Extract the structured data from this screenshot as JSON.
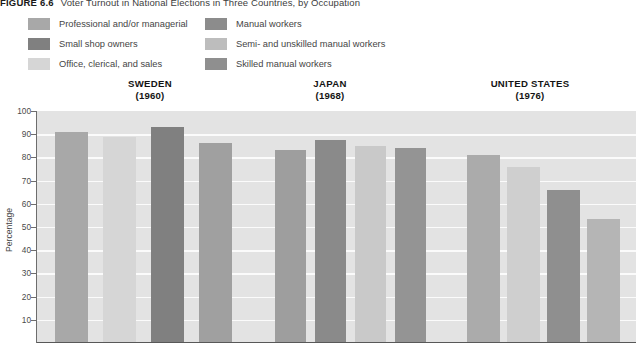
{
  "figure": {
    "number": "FIGURE 6.6",
    "title": "Voter Turnout in National Elections in Three Countries, by Occupation"
  },
  "legend": {
    "left_column": [
      {
        "label": "Professional and/or managerial",
        "color": "#a8a8a8",
        "swatch_name": "legend-swatch-professional"
      },
      {
        "label": "Small shop owners",
        "color": "#808080",
        "swatch_name": "legend-swatch-shop-owners"
      },
      {
        "label": "Office, clerical, and sales",
        "color": "#d6d6d6",
        "swatch_name": "legend-swatch-office-clerical"
      }
    ],
    "right_column": [
      {
        "label": "Manual workers",
        "color": "#8c8c8c",
        "swatch_name": "legend-swatch-manual"
      },
      {
        "label": "Semi- and unskilled manual workers",
        "color": "#bdbdbd",
        "swatch_name": "legend-swatch-semi-unskilled"
      },
      {
        "label": "Skilled manual workers",
        "color": "#8f8f8f",
        "swatch_name": "legend-swatch-skilled-manual"
      }
    ]
  },
  "country_headers": [
    {
      "name": "SWEDEN",
      "year": "(1960)"
    },
    {
      "name": "JAPAN",
      "year": "(1968)"
    },
    {
      "name": "UNITED STATES",
      "year": "(1976)"
    }
  ],
  "axis": {
    "y_title": "Percentage",
    "y_ticks": [
      "100",
      "90",
      "80",
      "70",
      "60",
      "50",
      "40",
      "30",
      "20",
      "10"
    ]
  },
  "chart_data": {
    "type": "bar",
    "title": "Voter Turnout in National Elections in Three Countries, by Occupation",
    "xlabel": "",
    "ylabel": "Percentage",
    "ylim": [
      0,
      100
    ],
    "grid": true,
    "legend_position": "top",
    "groups": [
      "SWEDEN (1960)",
      "JAPAN (1968)",
      "UNITED STATES (1976)"
    ],
    "bars": [
      {
        "group": "SWEDEN (1960)",
        "category": "Professional and/or managerial",
        "value": 91,
        "color": "#a8a8a8"
      },
      {
        "group": "SWEDEN (1960)",
        "category": "Office, clerical, and sales",
        "value": 89,
        "color": "#d6d6d6"
      },
      {
        "group": "SWEDEN (1960)",
        "category": "Small shop owners",
        "value": 93,
        "color": "#808080"
      },
      {
        "group": "SWEDEN (1960)",
        "category": "Manual workers",
        "value": 86,
        "color": "#a0a0a0"
      },
      {
        "group": "JAPAN (1968)",
        "category": "Professional and/or managerial",
        "value": 83,
        "color": "#9e9e9e"
      },
      {
        "group": "JAPAN (1968)",
        "category": "Small shop owners",
        "value": 87.5,
        "color": "#8a8a8a"
      },
      {
        "group": "JAPAN (1968)",
        "category": "Office, clerical, and sales",
        "value": 85,
        "color": "#c9c9c9"
      },
      {
        "group": "JAPAN (1968)",
        "category": "Manual workers",
        "value": 84,
        "color": "#949494"
      },
      {
        "group": "UNITED STATES (1976)",
        "category": "Professional and/or managerial",
        "value": 81,
        "color": "#ababab"
      },
      {
        "group": "UNITED STATES (1976)",
        "category": "Office, clerical, and sales",
        "value": 76,
        "color": "#cfcfcf"
      },
      {
        "group": "UNITED STATES (1976)",
        "category": "Skilled manual workers",
        "value": 66,
        "color": "#8f8f8f"
      },
      {
        "group": "UNITED STATES (1976)",
        "category": "Semi- and unskilled manual workers",
        "value": 53.5,
        "color": "#b5b5b5"
      }
    ]
  },
  "layout": {
    "plot_left": 37,
    "plot_width": 599,
    "bar_positions": [
      {
        "left": 18,
        "width": 33
      },
      {
        "left": 66,
        "width": 33
      },
      {
        "left": 114,
        "width": 33
      },
      {
        "left": 162,
        "width": 33
      },
      {
        "left": 238,
        "width": 31
      },
      {
        "left": 278,
        "width": 31
      },
      {
        "left": 318,
        "width": 31
      },
      {
        "left": 358,
        "width": 31
      },
      {
        "left": 430,
        "width": 33
      },
      {
        "left": 470,
        "width": 33
      },
      {
        "left": 510,
        "width": 33
      },
      {
        "left": 550,
        "width": 33
      }
    ],
    "country_header_positions": [
      {
        "left": 90,
        "width": 120
      },
      {
        "left": 280,
        "width": 100
      },
      {
        "left": 450,
        "width": 160
      }
    ]
  }
}
